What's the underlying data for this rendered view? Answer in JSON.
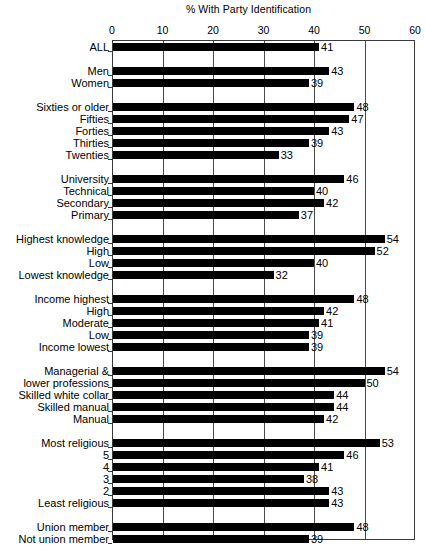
{
  "chart_data": {
    "type": "bar",
    "orientation": "horizontal",
    "title": "% With Party Identification",
    "xlabel": "",
    "ylabel": "",
    "xlim": [
      0,
      60
    ],
    "xticks": [
      0,
      10,
      20,
      30,
      40,
      50,
      60
    ],
    "xtick_labels": [
      "0",
      "10",
      "20",
      "30",
      "40",
      "50",
      "60"
    ],
    "grid": true,
    "legend": "none",
    "bar_color": "#000000",
    "categories": [
      "ALL",
      "Men",
      "Women",
      "Sixties or older",
      "Fifties",
      "Forties",
      "Thirties",
      "Twenties",
      "University",
      "Technical",
      "Secondary",
      "Primary",
      "Highest knowledge",
      "High",
      "Low",
      "Lowest knowledge",
      "Income highest",
      "High",
      "Moderate",
      "Low",
      "Income lowest",
      "Managerial &",
      "lower professions",
      "Skilled white collar",
      "Skilled manual",
      "Manual",
      "Most religious",
      "5",
      "4",
      "3",
      "2",
      "Least religious",
      "Union member",
      "Not union member",
      "Linguistic majority",
      "Linguistic minority"
    ],
    "values": [
      41,
      43,
      39,
      48,
      47,
      43,
      39,
      33,
      46,
      40,
      42,
      37,
      54,
      52,
      40,
      32,
      48,
      42,
      41,
      39,
      39,
      54,
      50,
      44,
      44,
      42,
      53,
      46,
      41,
      38,
      43,
      43,
      48,
      39,
      48,
      36
    ],
    "groups": [
      {
        "name": "all",
        "labels": [
          "ALL"
        ],
        "values": [
          41
        ]
      },
      {
        "name": "gender",
        "labels": [
          "Men",
          "Women"
        ],
        "values": [
          43,
          39
        ]
      },
      {
        "name": "age",
        "labels": [
          "Sixties or older",
          "Fifties",
          "Forties",
          "Thirties",
          "Twenties"
        ],
        "values": [
          48,
          47,
          43,
          39,
          33
        ]
      },
      {
        "name": "education",
        "labels": [
          "University",
          "Technical",
          "Secondary",
          "Primary"
        ],
        "values": [
          46,
          40,
          42,
          37
        ]
      },
      {
        "name": "political-knowledge",
        "labels": [
          "Highest knowledge",
          "High",
          "Low",
          "Lowest knowledge"
        ],
        "values": [
          54,
          52,
          40,
          32
        ]
      },
      {
        "name": "income",
        "labels": [
          "Income highest",
          "High",
          "Moderate",
          "Low",
          "Income lowest"
        ],
        "values": [
          48,
          42,
          41,
          39,
          39
        ]
      },
      {
        "name": "occupation",
        "labels": [
          "Managerial &",
          "lower professions",
          "Skilled white collar",
          "Skilled manual",
          "Manual"
        ],
        "values": [
          54,
          50,
          44,
          44,
          42
        ]
      },
      {
        "name": "religiosity",
        "labels": [
          "Most religious",
          "5",
          "4",
          "3",
          "2",
          "Least religious"
        ],
        "values": [
          53,
          46,
          41,
          38,
          43,
          43
        ]
      },
      {
        "name": "union",
        "labels": [
          "Union member",
          "Not union member"
        ],
        "values": [
          48,
          39
        ]
      },
      {
        "name": "language",
        "labels": [
          "Linguistic majority",
          "Linguistic minority"
        ],
        "values": [
          48,
          36
        ]
      }
    ]
  }
}
